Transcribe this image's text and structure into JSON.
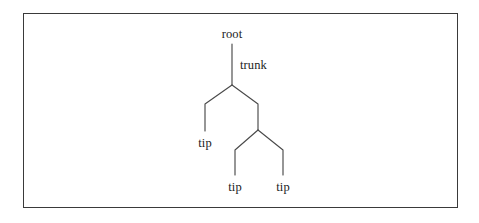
{
  "figure": {
    "type": "phylogenetic-tree-diagram",
    "background_color": "#ffffff",
    "frame_color": "#3a3a3a",
    "line_color": "#4a4a4a",
    "text_color": "#1c1c1c",
    "labels": {
      "root": "root",
      "trunk": "trunk",
      "tip_left": "tip",
      "tip_middle": "tip",
      "tip_right": "tip"
    },
    "nodes": [
      {
        "name": "root",
        "x": 232,
        "y": 44
      },
      {
        "name": "internal-node-1",
        "x": 232,
        "y": 85
      },
      {
        "name": "internal-node-2",
        "x": 258,
        "y": 130
      },
      {
        "name": "tip-left",
        "x": 205,
        "y": 131
      },
      {
        "name": "tip-middle",
        "x": 235,
        "y": 175
      },
      {
        "name": "tip-right",
        "x": 283,
        "y": 175
      }
    ],
    "edges": [
      {
        "name": "trunk-edge",
        "from": "root",
        "to": "internal-node-1"
      },
      {
        "name": "branch-to-tip-left",
        "from": "internal-node-1",
        "to": "tip-left"
      },
      {
        "name": "branch-to-internal-node-2",
        "from": "internal-node-1",
        "to": "internal-node-2"
      },
      {
        "name": "branch-to-tip-middle",
        "from": "internal-node-2",
        "to": "tip-middle"
      },
      {
        "name": "branch-to-tip-right",
        "from": "internal-node-2",
        "to": "tip-right"
      }
    ]
  }
}
